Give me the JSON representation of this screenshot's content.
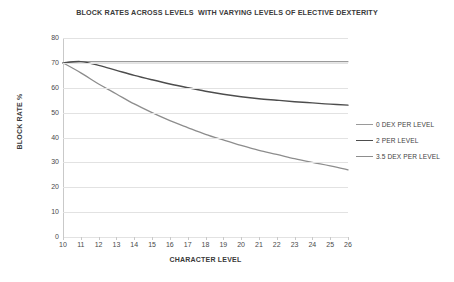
{
  "chart_data": {
    "type": "line",
    "title": "BLOCK RATES ACROSS LEVELS  WITH VARYING LEVELS OF ELECTIVE DEXTERITY",
    "xlabel": "CHARACTER LEVEL",
    "ylabel": "BLOCK RATE %",
    "x": [
      10,
      11,
      12,
      13,
      14,
      15,
      16,
      17,
      18,
      19,
      20,
      21,
      22,
      23,
      24,
      25,
      26
    ],
    "xlim": [
      10,
      26
    ],
    "ylim": [
      0,
      80
    ],
    "xtick_labels": [
      "10",
      "11",
      "12",
      "13",
      "14",
      "15",
      "16",
      "17",
      "18",
      "19",
      "20",
      "21",
      "22",
      "23",
      "24",
      "25",
      "26"
    ],
    "ytick_labels": [
      "0",
      "10",
      "20",
      "30",
      "40",
      "50",
      "60",
      "70",
      "80"
    ],
    "ytick_values": [
      0,
      10,
      20,
      30,
      40,
      50,
      60,
      70,
      80
    ],
    "grid": "horizontal",
    "legend_position": "right",
    "series": [
      {
        "name": "0 DEX PER LEVEL",
        "color": "#9a9a9a",
        "width": 1.1,
        "values": [
          70,
          70.5,
          70.5,
          70.5,
          70.5,
          70.5,
          70.5,
          70.5,
          70.5,
          70.5,
          70.5,
          70.5,
          70.5,
          70.5,
          70.5,
          70.5,
          70.5
        ]
      },
      {
        "name": "2 PER LEVEL",
        "color": "#4d4d4d",
        "width": 1.4,
        "values": [
          70,
          70.5,
          69,
          67,
          65,
          63.2,
          61.5,
          60,
          58.6,
          57.4,
          56.4,
          55.6,
          55,
          54.4,
          53.9,
          53.4,
          53
        ]
      },
      {
        "name": "3.5 DEX PER LEVEL",
        "color": "#8d8d8d",
        "width": 1.3,
        "values": [
          70,
          66,
          61.5,
          57.5,
          53.5,
          50,
          46.8,
          44,
          41.3,
          39,
          36.8,
          34.8,
          33.2,
          31.5,
          30,
          28.6,
          27
        ]
      }
    ]
  },
  "legend": {
    "items": [
      {
        "label": "0 DEX PER LEVEL"
      },
      {
        "label": "2 PER LEVEL"
      },
      {
        "label": "3.5 DEX PER LEVEL"
      }
    ]
  },
  "colors": {
    "gridline": "#e2e2e2",
    "axis": "#c9c9c9",
    "text": "#3f3f3f",
    "background": "#ffffff"
  }
}
